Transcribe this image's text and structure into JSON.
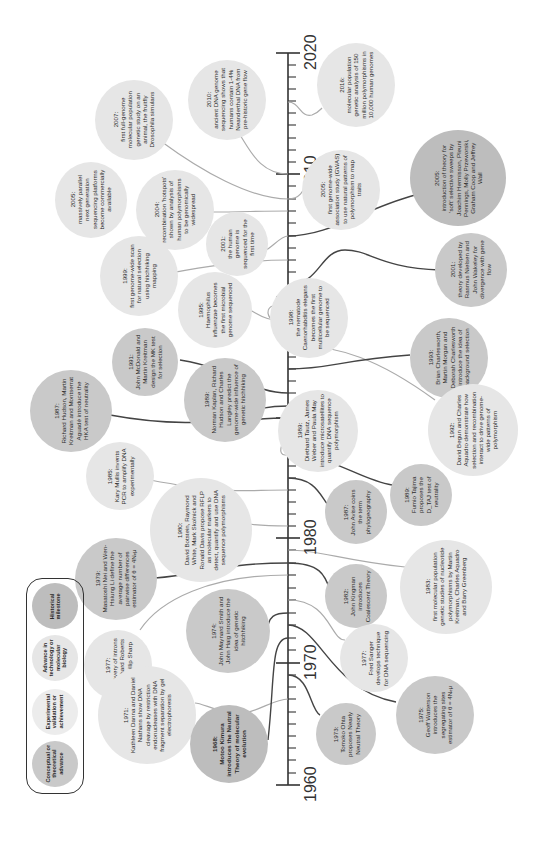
{
  "axis": {
    "years": [
      "1960",
      "1970",
      "1980",
      "1990",
      "2000",
      "2010",
      "2020"
    ],
    "label_positions_y": [
      785,
      663,
      538,
      418,
      297,
      174,
      53
    ]
  },
  "legend": {
    "items": [
      {
        "label": "Historical milestone",
        "style": "dark"
      },
      {
        "label": "Advance in technology or molecular biology",
        "style": "light"
      },
      {
        "label": "Experimental validation or achievement",
        "style": "exp"
      },
      {
        "label": "Conceptual or theoretical advance",
        "style": "med"
      }
    ]
  },
  "events": [
    {
      "id": "e2016",
      "year": "2016:",
      "text": "molecular population genetic analysis of 150 million polymorphisms in 10,000 human genomes"
    },
    {
      "id": "e2010",
      "year": "2010:",
      "text": "ancient DNA genome sequencing shows that humans contain 1-4% Neanderthal DNA from pre-historic gene flow"
    },
    {
      "id": "e2007",
      "year": "2007:",
      "text": "first full-genome molecular population genetic study on an animal, the fruitfly Drosophila simulans"
    },
    {
      "id": "e2005gwas",
      "year": "2005:",
      "text": "first genome-wide association study (GWAS) to use natural patterns of polymorphism to map traits"
    },
    {
      "id": "e2005soft",
      "year": "2005:",
      "text": "introduction of theory for 'soft' selective sweeps by Joachim Hermisson, Pleuni Pennings, Molly Przeworski, Graham Coop and Jeffrey Wall"
    },
    {
      "id": "e2005ngs",
      "year": "2005:",
      "text": "massively parallel next generation sequencing platforms become commercially available"
    },
    {
      "id": "e2004",
      "year": "2004:",
      "text": "recombination 'hotspots' shown by analysis of human polymorphisms to be genomically widespread"
    },
    {
      "id": "e2001genome",
      "year": "2001:",
      "text": "the human genome is sequenced for the first time"
    },
    {
      "id": "e1999",
      "year": "1999:",
      "text": "first genome-wide scan for natural selection using hitchhiking mapping"
    },
    {
      "id": "e1998",
      "year": "1998:",
      "text": "the nematode Caenorhabditis elegans becomes the first multicellular genome to be sequenced"
    },
    {
      "id": "e2001nielsen",
      "year": "2001:",
      "text": "theory developed by Rasmus Nielsen and John Wakeley for divergence with gene flow"
    },
    {
      "id": "e1995",
      "year": "1995:",
      "text": "Haemophilus influenzae becomes the first microbial genome sequenced"
    },
    {
      "id": "e1993",
      "year": "1993:",
      "text": "Brian Charlesworth, Martin Morgan and Deborah Charlesworth introduce the idea of background selection"
    },
    {
      "id": "e1991",
      "year": "1991:",
      "text": "John McDonald and Martin Kreitman design the MK test for selection"
    },
    {
      "id": "e1989kaplan",
      "year": "1989:",
      "text": "Norman Kaplan, Richard Hudson and Charles Langley predict the genome-wide influence of genetic hitchhiking"
    },
    {
      "id": "e1987hka",
      "year": "1987:",
      "text": "Richard Hudson, Martin Kreitman and Montserrat Aguadé introduce the HKA test of neutrality"
    },
    {
      "id": "e1989dietrich",
      "year": "1989:",
      "text": "Diethard Tautz, James Weber and Paula May introduce microsatellites to quantify DNA sequence polymorphism"
    },
    {
      "id": "e1992",
      "year": "1992:",
      "text": "David Begun and Charles Aquadro demonstrate how selection and recombination interact to drive genome-wide patterns of polymorphism"
    },
    {
      "id": "e1989tajima",
      "year": "1989:",
      "text": "Fumio Tajima proposes the D_TAJ test of neutrality"
    },
    {
      "id": "e1987avise",
      "year": "1987:",
      "text": "John Avise coins the term phylogeography"
    },
    {
      "id": "e1985",
      "year": "1985:",
      "text": "Kary Mullis invents PCR to amplify DNA experimentally"
    },
    {
      "id": "e1980",
      "year": "1980:",
      "text": "David Botstein, Raymond White, Mark Skolnick and Ronald Davis propose RFLP as molecular markers to detect, quantify and use DNA sequence polymorphisms"
    },
    {
      "id": "e1982",
      "year": "1982:",
      "text": "John Kingman introduces Coalescent Theory"
    },
    {
      "id": "e1983",
      "year": "1983:",
      "text": "first molecular population genetic studies of nucleotide polymorphisms by Martin Kreitman, Charles Aquadro and Barry Greenberg"
    },
    {
      "id": "e1979",
      "year": "1979:",
      "text": "Masatoshi Nei and Wen-Hsiung Li define the average number of pairwise differences estimator of θ = 4Nₑμ"
    },
    {
      "id": "e1977introns",
      "year": "1977:",
      "text": "Discovery of introns by Richard Roberts and Phillip Sharp"
    },
    {
      "id": "e1974",
      "year": "1974:",
      "text": "John Maynard Smith and John Haig introduce the idea of genetic hitchhiking"
    },
    {
      "id": "e1977sanger",
      "year": "1977:",
      "text": "Fred Sanger develops technique for DNA sequencing"
    },
    {
      "id": "e1971",
      "year": "1971:",
      "text": "Kathleen Danna and Daniel Nathans show DNA cleavage by restriction endonucleases with DNA fragment separation by gel electrophoresis"
    },
    {
      "id": "e1968",
      "year": "1968:",
      "text": "Motoo Kimura introduces the Neutral Theory of molecular evolution"
    },
    {
      "id": "e1975",
      "year": "1975:",
      "text": "Geoff Watterson introduces the segregating sites estimator of θ = 4Nₑμ"
    },
    {
      "id": "e1973",
      "year": "1973:",
      "text": "Tomoko Ohta proposes Nearly Neutral Theory"
    }
  ],
  "colors": {
    "axis": "#333333",
    "dark_line": "#4a4a4a",
    "light_line": "#a8a8a8",
    "circle_dark": "#bdbdbd",
    "circle_med": "#c9c9c9",
    "circle_light": "#e6e6e6"
  }
}
